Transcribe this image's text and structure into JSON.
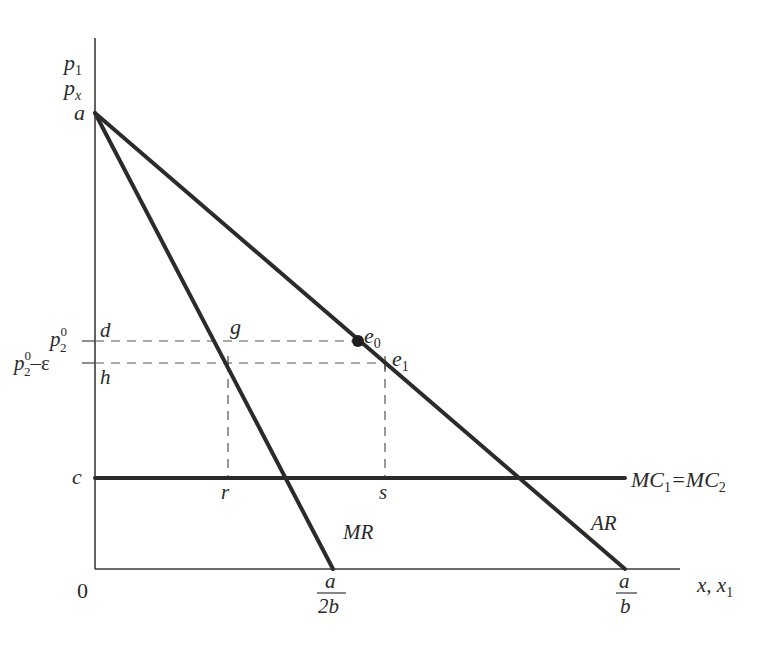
{
  "diagram": {
    "type": "monopoly-price-competition",
    "axes": {
      "y_label_line1": "p",
      "y_label_line1_sub": "1",
      "y_label_line2": "p",
      "y_label_line2_sub": "x",
      "x_label": "x, x",
      "x_label_sub": "1",
      "origin": "0"
    },
    "y_ticks": {
      "a": "a",
      "p2_0": "p",
      "p2_0_sup": "0",
      "p2_0_sub": "2",
      "p2_eps_base": "p",
      "p2_eps_sup": "0",
      "p2_eps_sub": "2",
      "p2_eps_tail": "–ε",
      "d": "d",
      "h": "h",
      "c": "c"
    },
    "x_ticks": {
      "r": "r",
      "s": "s",
      "a_2b_num": "a",
      "a_2b_den": "2b",
      "a_b_num": "a",
      "a_b_den": "b"
    },
    "points": {
      "g": "g",
      "e0": "e",
      "e0_sub": "0",
      "e1": "e",
      "e1_sub": "1"
    },
    "curves": {
      "mr": "MR",
      "ar": "AR",
      "mc_part1": "MC",
      "mc_sub1": "1",
      "mc_eq": "=MC",
      "mc_sub2": "2"
    },
    "colors": {
      "line": "#2b2b2b",
      "axis": "#3a3a3a",
      "background": "#ffffff"
    }
  }
}
